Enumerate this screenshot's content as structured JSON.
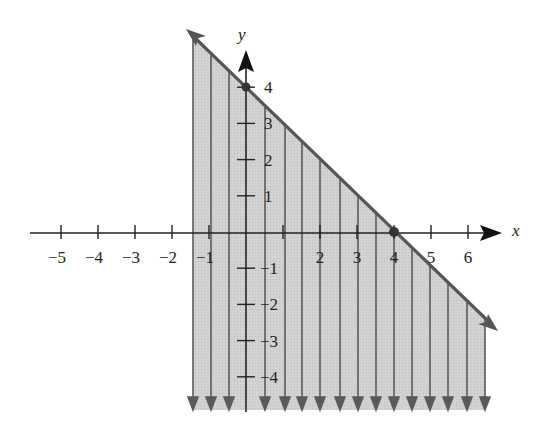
{
  "chart_data": {
    "type": "line",
    "title": "",
    "xlabel": "x",
    "ylabel": "y",
    "x_ticks": [
      -5,
      -4,
      -3,
      -2,
      -1,
      1,
      2,
      3,
      4,
      5,
      6
    ],
    "x_tick_labels": [
      "−5",
      "−4",
      "−3",
      "−2",
      "−1",
      "",
      "2",
      "3",
      "4",
      "5",
      "6"
    ],
    "y_ticks": [
      4,
      3,
      2,
      1,
      -1,
      -2,
      -3,
      -4
    ],
    "y_tick_labels": [
      "4",
      "3",
      "2",
      "1",
      "−1",
      "−2",
      "−3",
      "−4"
    ],
    "xlim": [
      -5.5,
      7
    ],
    "ylim": [
      -4.8,
      5.2
    ],
    "grid": false,
    "series": [
      {
        "name": "boundary line",
        "equation": "x + y = 4",
        "x": [
          -1.6,
          6.8
        ],
        "y": [
          5.6,
          -2.8
        ],
        "style": "solid, arrows both ends",
        "color": "#555555"
      }
    ],
    "points": [
      {
        "x": 0,
        "y": 4,
        "label": "y-intercept"
      },
      {
        "x": 4,
        "y": 0,
        "label": "x-intercept"
      }
    ],
    "shaded_region": {
      "relation": "below line",
      "inequality": "x + y <= 4",
      "fill_color": "#cfcfcf",
      "indicator": "vertical downward arrows"
    }
  },
  "axes": {
    "x_label": "x",
    "y_label": "y"
  },
  "colors": {
    "line": "#555555",
    "fill": "#cfcfcf",
    "axis": "#222222",
    "arrow": "#5a5a5a"
  }
}
